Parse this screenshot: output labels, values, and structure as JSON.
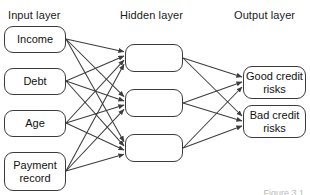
{
  "figure": {
    "type": "neural-network-diagram",
    "caption": "Figure 3.1",
    "width": 310,
    "height": 195,
    "stroke_color": "#3c3c3c",
    "background_color": "#ffffff"
  },
  "layers": {
    "input": {
      "title": "Input layer",
      "nodes": [
        {
          "label": "Income"
        },
        {
          "label": "Debt"
        },
        {
          "label": "Age"
        },
        {
          "label": "Payment record"
        }
      ]
    },
    "hidden": {
      "title": "Hidden layer",
      "nodes": [
        {
          "label": ""
        },
        {
          "label": ""
        },
        {
          "label": ""
        }
      ]
    },
    "output": {
      "title": "Output layer",
      "nodes": [
        {
          "label": "Good credit risks"
        },
        {
          "label": "Bad credit risks"
        }
      ]
    }
  },
  "connections": {
    "input_to_hidden": "fully-connected",
    "input_to_hidden_count": 12,
    "hidden_to_output": "fully-connected",
    "hidden_to_output_count": 6,
    "arrowheads": "directed-right"
  },
  "geometry": {
    "input_right_x": 66,
    "hidden_left_x": 125,
    "hidden_right_x": 183,
    "output_left_x": 243,
    "input_anchor_y": [
      39,
      81,
      123,
      171
    ],
    "hidden_anchor_y": [
      58,
      103,
      148
    ],
    "output_anchor_y": [
      82,
      121
    ]
  }
}
